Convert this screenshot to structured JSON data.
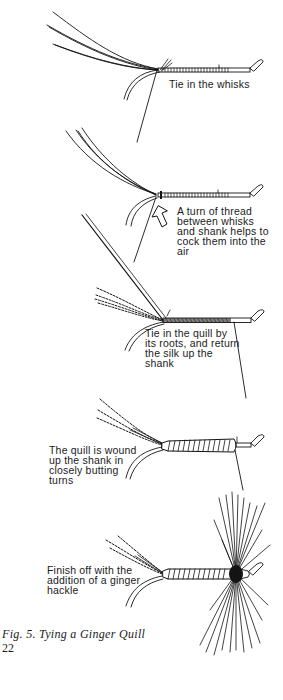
{
  "figure": {
    "caption": "Fig. 5.  Tying a Ginger Quill",
    "page_number": "22",
    "steps": [
      {
        "id": 1,
        "label": "Tie in the whisks"
      },
      {
        "id": 2,
        "label": "A turn of thread\nbetween whisks\nand shank helps to\ncock them into the\nair"
      },
      {
        "id": 3,
        "label": "Tie in the quill by\nits roots, and return\nthe silk up the\nshank"
      },
      {
        "id": 4,
        "label": "The quill is wound\nup the shank in\nclosely butting\nturns"
      },
      {
        "id": 5,
        "label": "Finish off with the\naddition of a ginger\nhackle"
      }
    ]
  },
  "colors": {
    "ink": "#141414",
    "paper": "#ffffff"
  }
}
